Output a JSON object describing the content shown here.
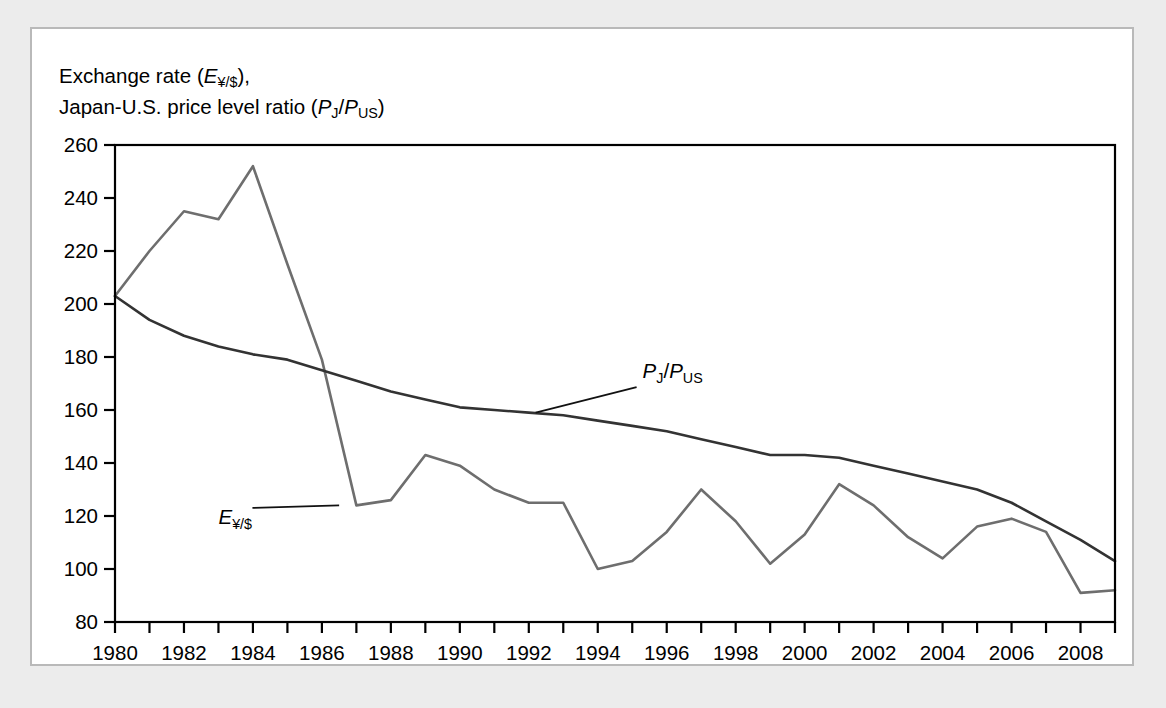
{
  "figure": {
    "axis_title_line1": "Exchange rate (E¥/$),",
    "axis_title_line2": "Japan-U.S. price level ratio (PJ/PUS)"
  },
  "chart_data": {
    "type": "line",
    "title": "",
    "xlabel": "",
    "ylabel": "Exchange rate (E¥/$), Japan-U.S. price level ratio (PJ/PUS)",
    "xlim": [
      1980,
      2009
    ],
    "ylim": [
      80,
      260
    ],
    "ytick_step": 20,
    "xtick_step": 1,
    "xtick_label_step": 2,
    "grid": false,
    "legend": "inline-annotations",
    "x": [
      1980,
      1981,
      1982,
      1983,
      1984,
      1985,
      1986,
      1987,
      1988,
      1989,
      1990,
      1991,
      1992,
      1993,
      1994,
      1995,
      1996,
      1997,
      1998,
      1999,
      2000,
      2001,
      2002,
      2003,
      2004,
      2005,
      2006,
      2007,
      2008,
      2009
    ],
    "xtick_labels": [
      "1980",
      "",
      "1982",
      "",
      "1984",
      "",
      "1986",
      "",
      "1988",
      "",
      "1990",
      "",
      "1992",
      "",
      "1994",
      "",
      "1996",
      "",
      "1998",
      "",
      "2000",
      "",
      "2002",
      "",
      "2004",
      "",
      "2006",
      "",
      "2008",
      ""
    ],
    "ytick_labels": [
      "80",
      "100",
      "120",
      "140",
      "160",
      "180",
      "200",
      "220",
      "240",
      "260"
    ],
    "series": [
      {
        "name": "E¥/$",
        "label": "E¥/$",
        "color": "#6e6e6e",
        "values": [
          203,
          220,
          235,
          232,
          252,
          215,
          179,
          124,
          126,
          143,
          139,
          130,
          125,
          125,
          100,
          103,
          114,
          130,
          118,
          102,
          113,
          132,
          124,
          112,
          104,
          116,
          119,
          114,
          91,
          92
        ]
      },
      {
        "name": "PJ/PUS",
        "label": "PJ/PUS",
        "color": "#333333",
        "values": [
          203,
          194,
          188,
          184,
          181,
          179,
          175,
          171,
          167,
          164,
          161,
          160,
          159,
          158,
          156,
          154,
          152,
          149,
          146,
          143,
          143,
          142,
          139,
          136,
          133,
          130,
          125,
          118,
          111,
          103
        ]
      }
    ],
    "annotations": [
      {
        "text": "PJ/PUS",
        "series": "PJ/PUS",
        "x": 1995.3,
        "y": 172
      },
      {
        "text": "E¥/$",
        "series": "E¥/$",
        "x": 1983.0,
        "y": 117
      }
    ]
  }
}
